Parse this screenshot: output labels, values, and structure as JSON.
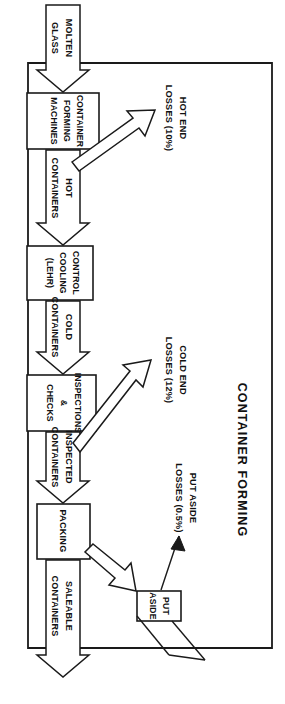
{
  "diagram": {
    "title": "CONTAINER FORMING",
    "orientation": "rotated-90-clockwise",
    "type": "process-flow",
    "colors": {
      "ink": "#1a1a1a",
      "paper": "#ffffff"
    },
    "input": {
      "label_line1": "MOLTEN",
      "label_line2": "GLASS"
    },
    "process_boxes": [
      {
        "id": "forming",
        "lines": [
          "CONTAINER",
          "FORMING",
          "MACHINES"
        ]
      },
      {
        "id": "lehr",
        "lines": [
          "CONTROL",
          "COOLING",
          "(LEHR)"
        ]
      },
      {
        "id": "inspect",
        "lines": [
          "INSPECTIONS",
          "&",
          "CHECKS"
        ]
      },
      {
        "id": "packing",
        "lines": [
          "PACKING"
        ]
      },
      {
        "id": "putaside",
        "lines": [
          "PUT",
          "ASIDE"
        ]
      }
    ],
    "flow_labels": [
      {
        "id": "hot-containers",
        "line1": "HOT",
        "line2": "CONTAINERS"
      },
      {
        "id": "cold-containers",
        "line1": "COLD",
        "line2": "CONTAINERS"
      },
      {
        "id": "inspected-containers",
        "line1": "INSPECTED",
        "line2": "CONTAINERS"
      },
      {
        "id": "saleable-containers",
        "line1": "SALEABLE",
        "line2": "CONTAINERS"
      }
    ],
    "loss_labels": [
      {
        "id": "hot-end",
        "line1": "HOT END",
        "line2": "LOSSES (10%)",
        "value": "10%"
      },
      {
        "id": "cold-end",
        "line1": "COLD END",
        "line2": "LOSSES (12%)",
        "value": "12%"
      },
      {
        "id": "put-aside",
        "line1": "PUT ASIDE",
        "line2": "LOSSES (0.5%)",
        "value": "0.5%"
      }
    ]
  }
}
